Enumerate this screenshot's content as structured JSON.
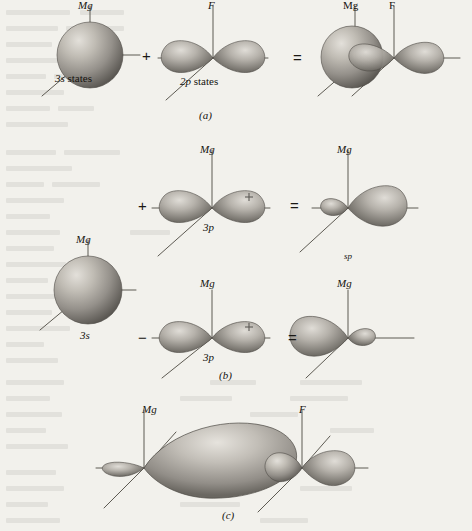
{
  "figure": {
    "caption_panels": [
      {
        "id": "a",
        "label": "(a)"
      },
      {
        "id": "b",
        "label": "(b)"
      },
      {
        "id": "c",
        "label": "(c)"
      }
    ]
  },
  "colors": {
    "page_background": "#f2f1ec",
    "ink": "#15130f",
    "axis_line": "#5d5a52",
    "orbital_light": "#d8d5cf",
    "orbital_mid": "#9c9890",
    "orbital_dark": "#55524c",
    "bleed_text": "#4a463e"
  },
  "panel_a": {
    "label": "(a)",
    "operator_plus": "+",
    "operator_equals": "=",
    "items": [
      {
        "name": "s-orbital-sphere",
        "axis_label": "Mg",
        "caption": "3s states"
      },
      {
        "name": "p-orbital-dumbbell",
        "axis_label": "F",
        "caption": "2p states"
      },
      {
        "name": "combined-orbital",
        "axis_label_left": "Mg",
        "axis_label_right": "F",
        "caption": ""
      }
    ]
  },
  "panel_b": {
    "label": "(b)",
    "operator_plus": "+",
    "operator_minus": "−",
    "operator_equals_top": "=",
    "operator_equals_bottom": "=",
    "s_orbital": {
      "axis_label": "Mg",
      "caption": "3s"
    },
    "rows": [
      {
        "p_orbital": {
          "axis_label": "Mg",
          "caption": "3p",
          "lobe_sign": "+"
        },
        "result": {
          "axis_label": "Mg",
          "caption": "sp"
        }
      },
      {
        "p_orbital": {
          "axis_label": "Mg",
          "caption": "3p",
          "lobe_sign": "+"
        },
        "result": {
          "axis_label": "Mg",
          "caption": ""
        }
      }
    ]
  },
  "panel_c": {
    "label": "(c)",
    "axis_label_left": "Mg",
    "axis_label_right": "F",
    "description": "bonding molecular orbital"
  },
  "bleed_lines": [
    {
      "x": 6,
      "y": 10,
      "w": 64
    },
    {
      "x": 80,
      "y": 10,
      "w": 44
    },
    {
      "x": 6,
      "y": 26,
      "w": 52
    },
    {
      "x": 66,
      "y": 26,
      "w": 58
    },
    {
      "x": 6,
      "y": 42,
      "w": 46
    },
    {
      "x": 60,
      "y": 42,
      "w": 30
    },
    {
      "x": 6,
      "y": 58,
      "w": 70
    },
    {
      "x": 6,
      "y": 74,
      "w": 40
    },
    {
      "x": 54,
      "y": 74,
      "w": 52
    },
    {
      "x": 6,
      "y": 90,
      "w": 58
    },
    {
      "x": 6,
      "y": 106,
      "w": 44
    },
    {
      "x": 58,
      "y": 106,
      "w": 36
    },
    {
      "x": 6,
      "y": 122,
      "w": 62
    },
    {
      "x": 6,
      "y": 150,
      "w": 50
    },
    {
      "x": 64,
      "y": 150,
      "w": 56
    },
    {
      "x": 6,
      "y": 166,
      "w": 66
    },
    {
      "x": 6,
      "y": 182,
      "w": 38
    },
    {
      "x": 52,
      "y": 182,
      "w": 48
    },
    {
      "x": 6,
      "y": 198,
      "w": 58
    },
    {
      "x": 6,
      "y": 214,
      "w": 44
    },
    {
      "x": 6,
      "y": 230,
      "w": 54
    },
    {
      "x": 130,
      "y": 230,
      "w": 40
    },
    {
      "x": 6,
      "y": 246,
      "w": 48
    },
    {
      "x": 6,
      "y": 262,
      "w": 60
    },
    {
      "x": 6,
      "y": 278,
      "w": 42
    },
    {
      "x": 6,
      "y": 294,
      "w": 56
    },
    {
      "x": 6,
      "y": 310,
      "w": 46
    },
    {
      "x": 6,
      "y": 326,
      "w": 64
    },
    {
      "x": 6,
      "y": 342,
      "w": 38
    },
    {
      "x": 6,
      "y": 358,
      "w": 52
    },
    {
      "x": 6,
      "y": 380,
      "w": 58
    },
    {
      "x": 210,
      "y": 380,
      "w": 46
    },
    {
      "x": 300,
      "y": 380,
      "w": 62
    },
    {
      "x": 6,
      "y": 396,
      "w": 44
    },
    {
      "x": 180,
      "y": 396,
      "w": 52
    },
    {
      "x": 290,
      "y": 396,
      "w": 58
    },
    {
      "x": 6,
      "y": 412,
      "w": 56
    },
    {
      "x": 250,
      "y": 412,
      "w": 48
    },
    {
      "x": 6,
      "y": 428,
      "w": 40
    },
    {
      "x": 200,
      "y": 428,
      "w": 54
    },
    {
      "x": 330,
      "y": 428,
      "w": 44
    },
    {
      "x": 6,
      "y": 444,
      "w": 62
    },
    {
      "x": 6,
      "y": 470,
      "w": 50
    },
    {
      "x": 220,
      "y": 470,
      "w": 46
    },
    {
      "x": 6,
      "y": 486,
      "w": 58
    },
    {
      "x": 300,
      "y": 486,
      "w": 52
    },
    {
      "x": 6,
      "y": 502,
      "w": 42
    },
    {
      "x": 180,
      "y": 502,
      "w": 60
    },
    {
      "x": 6,
      "y": 518,
      "w": 54
    },
    {
      "x": 260,
      "y": 518,
      "w": 48
    }
  ]
}
